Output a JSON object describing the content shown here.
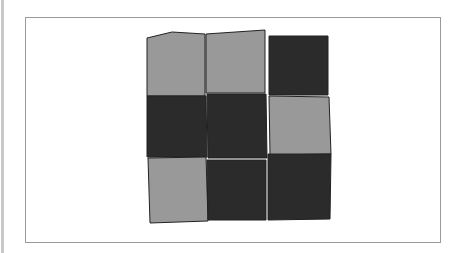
{
  "game": {
    "type": "tile-grid",
    "rows": 3,
    "cols": 3,
    "colors": {
      "light": "#999999",
      "dark": "#2b2b2b",
      "frame": "#9a9a9a"
    },
    "tiles": [
      [
        "light",
        "light",
        "dark"
      ],
      [
        "dark",
        "dark",
        "light"
      ],
      [
        "light",
        "dark",
        "dark"
      ]
    ]
  }
}
